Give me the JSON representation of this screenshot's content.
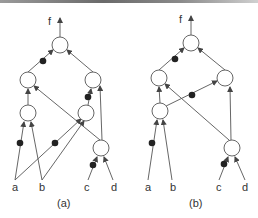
{
  "figure": {
    "panels": [
      {
        "id": "a",
        "caption": "(a)",
        "output_label": "f",
        "inputs": [
          "a",
          "b",
          "c",
          "d"
        ]
      },
      {
        "id": "b",
        "caption": "(b)",
        "output_label": "f",
        "inputs": [
          "a",
          "b",
          "c",
          "d"
        ]
      }
    ],
    "colors": {
      "stroke": "#444444",
      "node_fill": "#ffffff",
      "dot": "#222222",
      "text": "#333333"
    }
  }
}
